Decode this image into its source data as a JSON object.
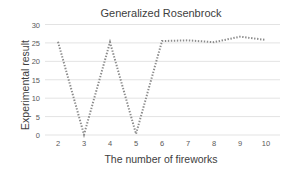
{
  "chart_data": {
    "type": "line",
    "title": "Generalized Rosenbrock",
    "xlabel": "The number of fireworks",
    "ylabel": "Experimental result",
    "categories": [
      "2",
      "3",
      "4",
      "5",
      "6",
      "7",
      "8",
      "9",
      "10"
    ],
    "series": [
      {
        "name": "Generalized Rosenbrock",
        "values": [
          25.3,
          0.1,
          25.2,
          0.3,
          25.5,
          25.7,
          25.2,
          26.7,
          25.8
        ],
        "style": "dotted",
        "color": "#8c8c8c"
      }
    ],
    "yticks": [
      0,
      5,
      10,
      15,
      20,
      25,
      30
    ],
    "ylim": [
      0,
      30
    ],
    "grid": true,
    "legend": "none"
  }
}
